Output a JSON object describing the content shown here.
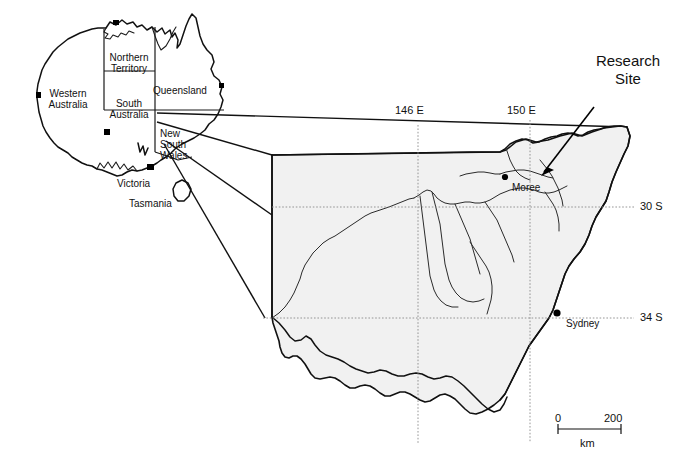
{
  "figure": {
    "background_color": "#ffffff",
    "ink_color": "#111111",
    "region_fill_color": "#f1f1f1"
  },
  "inset": {
    "name": "australia-inset",
    "states": [
      {
        "key": "western-australia",
        "label": "Western\nAustralia"
      },
      {
        "key": "northern-territory",
        "label": "Northern\nTerritory"
      },
      {
        "key": "queensland",
        "label": "Queensland"
      },
      {
        "key": "south-australia",
        "label": "South\nAustralia"
      },
      {
        "key": "new-south-wales",
        "label": "New\nSouth\nWales"
      },
      {
        "key": "victoria",
        "label": "Victoria"
      },
      {
        "key": "tasmania",
        "label": "Tasmania"
      }
    ]
  },
  "main_map": {
    "name": "new-south-wales-detail-map",
    "longitude_ticks": [
      {
        "key": "146E",
        "label": "146 E"
      },
      {
        "key": "150E",
        "label": "150 E"
      }
    ],
    "latitude_ticks": [
      {
        "key": "30S",
        "label": "30 S"
      },
      {
        "key": "34S",
        "label": "34 S"
      }
    ],
    "places": [
      {
        "key": "moree",
        "label": "Moree"
      },
      {
        "key": "sydney",
        "label": "Sydney"
      }
    ],
    "annotation": {
      "key": "research-site",
      "label": "Research\nSite"
    },
    "scale_bar": {
      "start_label": "0",
      "end_label": "200",
      "unit_label": "km"
    }
  }
}
